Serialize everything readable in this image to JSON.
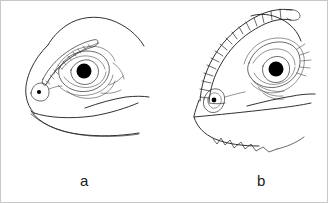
{
  "figure": {
    "kind": "scientific-line-drawing",
    "background_color": "#ffffff",
    "ink_color": "#1a1a1a",
    "border_color": "#c8c8c8",
    "width": 328,
    "height": 203,
    "panels": [
      {
        "id": "a",
        "label": "a",
        "label_x": 79,
        "label_y": 172,
        "description": "lizard head in left-facing lateral profile with a low elongated row of enlarged supraocular scales above the eye, rounded snout, visible nostril and long straight jaw line",
        "features": [
          "rounded cranial dome",
          "elongated beaded supraocular scale row",
          "large round eye with solid black pupil",
          "concentric palpebral folds around eye",
          "circular nostril with black dot",
          "long gently curved lower jaw",
          "gular fold line below jaw"
        ]
      },
      {
        "id": "b",
        "label": "b",
        "label_x": 256,
        "label_y": 172,
        "description": "lizard head in left-facing lateral profile with a tall arched segmented crest of enlarged scales sweeping from the snout over the brow, enlarged eye with radiating palpebral scales, and a serrated gular fringe along the jaw",
        "features": [
          "tall arched segmented supraciliary crest",
          "boxy stacked crest segments",
          "large eye with solid black pupil",
          "radiating palpebral scale striations",
          "keeled nostril scale with black dot",
          "straight angular jaw line",
          "serrated gular fringe with spiny projections"
        ]
      }
    ]
  }
}
